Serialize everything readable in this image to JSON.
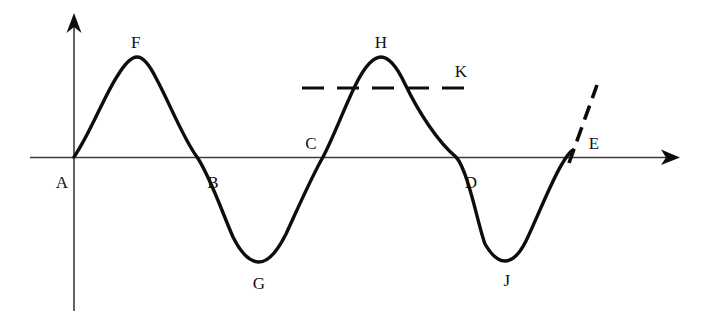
{
  "figure": {
    "type": "sine-wave-diagram",
    "background_color": "#ffffff",
    "curve_color": "#0d0d0d",
    "axis_color": "#3c3c3c",
    "label_color": "#111111",
    "axes": {
      "x_axis": {
        "name": "horizontal-axis",
        "start_x": 30,
        "end_x": 678,
        "y": 157,
        "arrow": "right"
      },
      "y_axis": {
        "name": "vertical-axis",
        "x": 74,
        "top_y": 14,
        "bottom_y": 311,
        "arrow": "up"
      }
    },
    "dashed_horizontal": {
      "name": "dashed-level-line",
      "x1": 302,
      "x2": 476,
      "y": 88
    },
    "dashed_diagonal": {
      "name": "dashed-tangent-line",
      "x1": 569,
      "y1": 162,
      "x2": 597,
      "y2": 86
    }
  },
  "labels": [
    {
      "id": "A",
      "text": "A",
      "x": 62,
      "y": 182,
      "role": "origin-zero-crossing"
    },
    {
      "id": "B",
      "text": "B",
      "x": 213,
      "y": 182,
      "role": "zero-crossing"
    },
    {
      "id": "C",
      "text": "C",
      "x": 311,
      "y": 143,
      "role": "zero-crossing"
    },
    {
      "id": "D",
      "text": "D",
      "x": 471,
      "y": 182,
      "role": "zero-crossing"
    },
    {
      "id": "E",
      "text": "E",
      "x": 594,
      "y": 143,
      "role": "dashed-line-end"
    },
    {
      "id": "F",
      "text": "F",
      "x": 136,
      "y": 42,
      "role": "first-maximum"
    },
    {
      "id": "G",
      "text": "G",
      "x": 259,
      "y": 283,
      "role": "first-minimum"
    },
    {
      "id": "H",
      "text": "H",
      "x": 381,
      "y": 42,
      "role": "second-maximum"
    },
    {
      "id": "J",
      "text": "J",
      "x": 507,
      "y": 280,
      "role": "second-minimum"
    },
    {
      "id": "K",
      "text": "K",
      "x": 461,
      "y": 71,
      "role": "dashed-line-label"
    }
  ],
  "chart_data": {
    "type": "line",
    "title": "",
    "xlabel": "",
    "ylabel": "",
    "grid": false,
    "legend": false,
    "curve_points_px": [
      {
        "label": "A",
        "x": 74,
        "y": 157
      },
      {
        "label": "F",
        "x": 137,
        "y": 58
      },
      {
        "label": "B",
        "x": 197,
        "y": 157
      },
      {
        "label": "G",
        "x": 259,
        "y": 262
      },
      {
        "label": "C",
        "x": 323,
        "y": 157
      },
      {
        "label": "H",
        "x": 381,
        "y": 57
      },
      {
        "label": "D",
        "x": 456,
        "y": 157
      },
      {
        "label": "J",
        "x": 505,
        "y": 261
      },
      {
        "label": "end",
        "x": 573,
        "y": 150
      }
    ],
    "named_points": {
      "zero_crossings": [
        "A",
        "B",
        "C",
        "D"
      ],
      "maxima": [
        "F",
        "H"
      ],
      "minima": [
        "G",
        "J"
      ],
      "dashed_line_label": "K",
      "tangent_label": "E"
    },
    "series": [
      {
        "name": "wave",
        "x": [
          0,
          1,
          2,
          3,
          4,
          5,
          6,
          7,
          8
        ],
        "values": [
          0,
          1,
          0,
          -1,
          0,
          1,
          0,
          -1,
          0.1
        ]
      }
    ],
    "xlim": [
      0,
      8
    ],
    "ylim": [
      -1.15,
      1.15
    ]
  }
}
